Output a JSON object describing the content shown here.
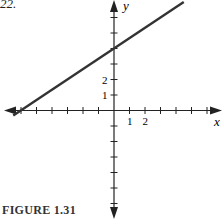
{
  "problem_number": "22.",
  "caption": "FIGURE 1.31",
  "axis_labels": {
    "x": "x",
    "y": "y"
  },
  "tick_labels": {
    "x": [
      "1",
      "2"
    ],
    "y": [
      "1",
      "2"
    ]
  },
  "colors": {
    "line": "#333333",
    "axes": "#222222"
  },
  "chart_data": {
    "type": "line",
    "title": "FIGURE 1.31",
    "xlabel": "x",
    "ylabel": "y",
    "xlim": [
      -7,
      7
    ],
    "ylim": [
      -7,
      7
    ],
    "grid": false,
    "legend": null,
    "labeled_ticks": {
      "x": [
        1,
        2
      ],
      "y": [
        1,
        2
      ]
    },
    "x_ticks": [
      -6,
      -5,
      -4,
      -3,
      -2,
      -1,
      1,
      2,
      3,
      4,
      5,
      6
    ],
    "y_ticks": [
      -6,
      -5,
      -4,
      -3,
      -2,
      -1,
      1,
      2,
      3,
      4,
      5,
      6
    ],
    "series": [
      {
        "name": "line",
        "equation": "y = (2/3)x + 4",
        "x": [
          -6.5,
          -6,
          0,
          4.5
        ],
        "y": [
          -0.33,
          0,
          4,
          7
        ]
      }
    ],
    "annotations": {
      "x_intercept": [
        -6,
        0
      ],
      "y_intercept": [
        0,
        4
      ]
    }
  }
}
